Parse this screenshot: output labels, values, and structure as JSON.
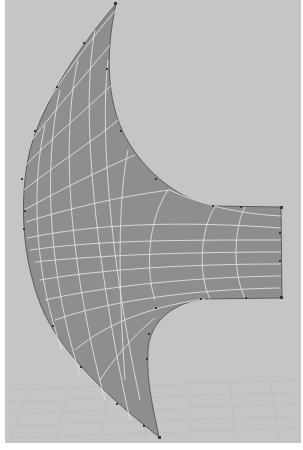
{
  "viewport": {
    "background": "#c5c5c5",
    "grid_color": "#b7b7b7",
    "surface_fill": "#8e8e8e",
    "isoparm_color": "#e2e2e2",
    "cv_color": "#3a3a3a"
  },
  "surface": {
    "name": "nurbs-surface",
    "type": "curved wedge with rectangular extension",
    "u_isoparms": 9,
    "v_isoparms": 12
  }
}
